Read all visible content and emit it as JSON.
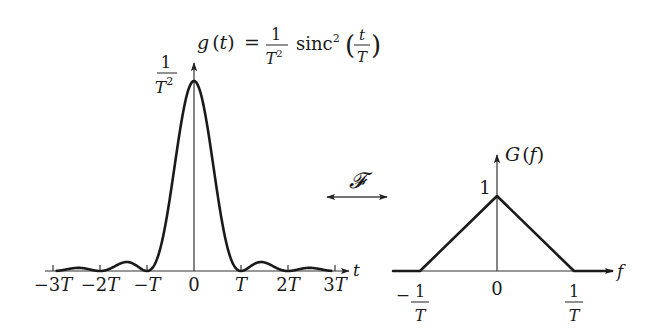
{
  "left_plot": {
    "title_lhs": "g",
    "title_arg": "t",
    "title_eq": "=",
    "title_frac_num": "1",
    "title_frac_den": "T",
    "title_frac_den_exp": "2",
    "title_func": "sinc",
    "title_func_exp": "2",
    "title_inner_num": "t",
    "title_inner_den": "T",
    "peak_label_num": "1",
    "peak_label_den": "T",
    "peak_label_den_exp": "2",
    "axis_label": "t",
    "ticks": [
      {
        "label": "−3T",
        "value": -3
      },
      {
        "label": "−2T",
        "value": -2
      },
      {
        "label": "−T",
        "value": -1
      },
      {
        "label": "0",
        "value": 0
      },
      {
        "label": "T",
        "value": 1
      },
      {
        "label": "2T",
        "value": 2
      },
      {
        "label": "3T",
        "value": 3
      }
    ]
  },
  "transform": {
    "symbol": "𝓕",
    "arrow": "double-headed-arrow"
  },
  "right_plot": {
    "title_func": "G",
    "title_arg": "f",
    "peak_label": "1",
    "axis_label": "f",
    "ticks": [
      {
        "sign": "−",
        "num": "1",
        "den": "T",
        "value": -1
      },
      {
        "sign": "",
        "num": "0",
        "den": "",
        "value": 0
      },
      {
        "sign": "",
        "num": "1",
        "den": "T",
        "value": 1
      }
    ]
  },
  "chart_data": [
    {
      "type": "line",
      "title": "g(t) = (1/T²) sinc²(t/T)",
      "xlabel": "t",
      "ylabel": "g(t)",
      "x_ticks": [
        "−3T",
        "−2T",
        "−T",
        "0",
        "T",
        "2T",
        "3T"
      ],
      "x": [
        -3,
        -2.5,
        -2,
        -1.5,
        -1,
        -0.5,
        0,
        0.5,
        1,
        1.5,
        2,
        2.5,
        3
      ],
      "values": [
        0,
        0.016,
        0,
        0.045,
        0,
        0.405,
        1,
        0.405,
        0,
        0.045,
        0,
        0.016,
        0
      ],
      "y_peak_label": "1/T²",
      "xlim": [
        -3.2,
        3.3
      ],
      "grid": false
    },
    {
      "type": "line",
      "title": "G(f)",
      "xlabel": "f",
      "ylabel": "G(f)",
      "x_ticks": [
        "−1/T",
        "0",
        "1/T"
      ],
      "x": [
        -1.4,
        -1,
        0,
        1,
        1.8
      ],
      "values": [
        0,
        0,
        1,
        0,
        0
      ],
      "y_peak_label": "1",
      "grid": false
    }
  ]
}
